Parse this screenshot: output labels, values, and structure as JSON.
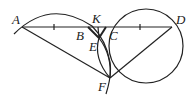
{
  "figure": {
    "type": "geometry",
    "stroke_color": "#222222",
    "points": [
      {
        "name": "A",
        "label": "A"
      },
      {
        "name": "B",
        "label": "B"
      },
      {
        "name": "K",
        "label": "K"
      },
      {
        "name": "C",
        "label": "C"
      },
      {
        "name": "D",
        "label": "D"
      },
      {
        "name": "E",
        "label": "E"
      },
      {
        "name": "F",
        "label": "F"
      }
    ],
    "segments": [
      "AD",
      "AF",
      "DF",
      "BE",
      "CE",
      "KE"
    ],
    "tick_marks": [
      "AB",
      "CD"
    ]
  }
}
